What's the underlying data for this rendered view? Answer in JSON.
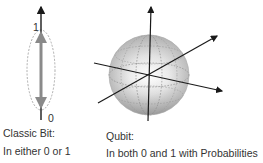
{
  "classic_bit": {
    "label_one": "1",
    "label_zero": "0",
    "title": "Classic Bit:",
    "description": "In either 0 or 1"
  },
  "qubit": {
    "title": "Qubit:",
    "description": "In both 0 and 1 with Probabilities"
  },
  "colors": {
    "axis": "#1a1a1a",
    "state_arrow": "#8a8a8a",
    "sphere_light": "#f2f2f2",
    "sphere_dark": "#9a9a9a",
    "dashed": "#888888",
    "text": "#333333"
  }
}
